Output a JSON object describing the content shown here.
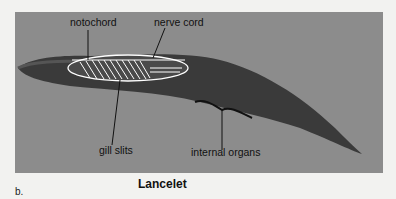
{
  "figure": {
    "title": "Lancelet",
    "part_label": "b.",
    "labels": {
      "notochord": "notochord",
      "nerve_cord": "nerve cord",
      "gill_slits": "gill slits",
      "internal_organs": "internal organs"
    },
    "colors": {
      "background": "#f2f2f0",
      "photo_panel": "#8c8c8c",
      "body": "#3a3a3a",
      "outline": "#ffffff",
      "text": "#111111"
    }
  }
}
